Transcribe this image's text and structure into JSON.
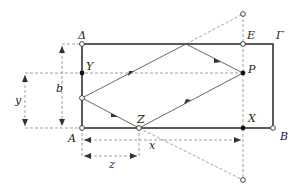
{
  "diagram": {
    "labels": {
      "Delta": "Δ",
      "E": "E",
      "Gamma": "Γ",
      "Y": "Y",
      "P": "P",
      "A": "A",
      "Z": "Z",
      "X": "X",
      "B": "B",
      "b": "b",
      "y": "y",
      "x": "x",
      "z": "z"
    },
    "colors": {
      "frame": "#333333",
      "path": "#555555",
      "dashed": "#777777"
    }
  }
}
